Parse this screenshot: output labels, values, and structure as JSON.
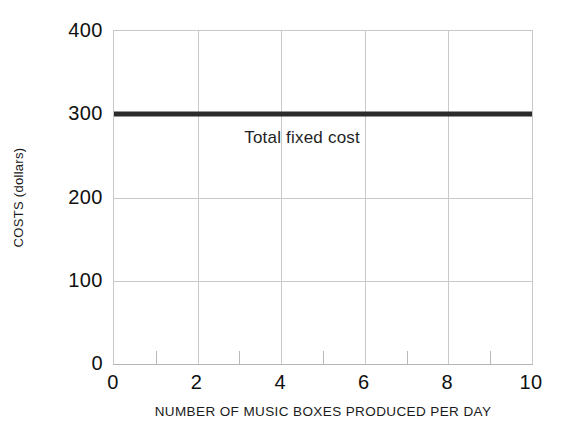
{
  "chart_data": {
    "type": "line",
    "title": "",
    "xlabel": "NUMBER OF MUSIC BOXES PRODUCED PER DAY",
    "ylabel": "COSTS (dollars)",
    "xlim": [
      0,
      10
    ],
    "ylim": [
      0,
      400
    ],
    "grid": true,
    "legend_position": "none",
    "x_ticks": [
      0,
      2,
      4,
      6,
      8,
      10
    ],
    "x_tick_labels": [
      "0",
      "2",
      "4",
      "6",
      "8",
      "10"
    ],
    "x_minor_ticks": [
      1,
      3,
      5,
      7,
      9
    ],
    "y_ticks": [
      0,
      100,
      200,
      300,
      400
    ],
    "y_tick_labels": [
      "0",
      "100",
      "200",
      "300",
      "400"
    ],
    "y_gridlines": [
      100,
      200,
      300
    ],
    "x_gridlines": [
      2,
      4,
      6,
      8
    ],
    "series": [
      {
        "name": "Total fixed cost",
        "color": "#2b2b2b",
        "line_width": 5,
        "x": [
          0,
          1,
          2,
          3,
          4,
          5,
          6,
          7,
          8,
          9,
          10
        ],
        "values": [
          300,
          300,
          300,
          300,
          300,
          300,
          300,
          300,
          300,
          300,
          300
        ]
      }
    ],
    "annotations": [
      {
        "text": "Total fixed cost",
        "x": 4.5,
        "y": 272,
        "color": "#1f1f1f"
      }
    ],
    "colors": {
      "background": "#ffffff",
      "grid": "#c9c9c9",
      "axis": "#b4b4b4",
      "text": "#101010",
      "series": "#2b2b2b"
    }
  }
}
